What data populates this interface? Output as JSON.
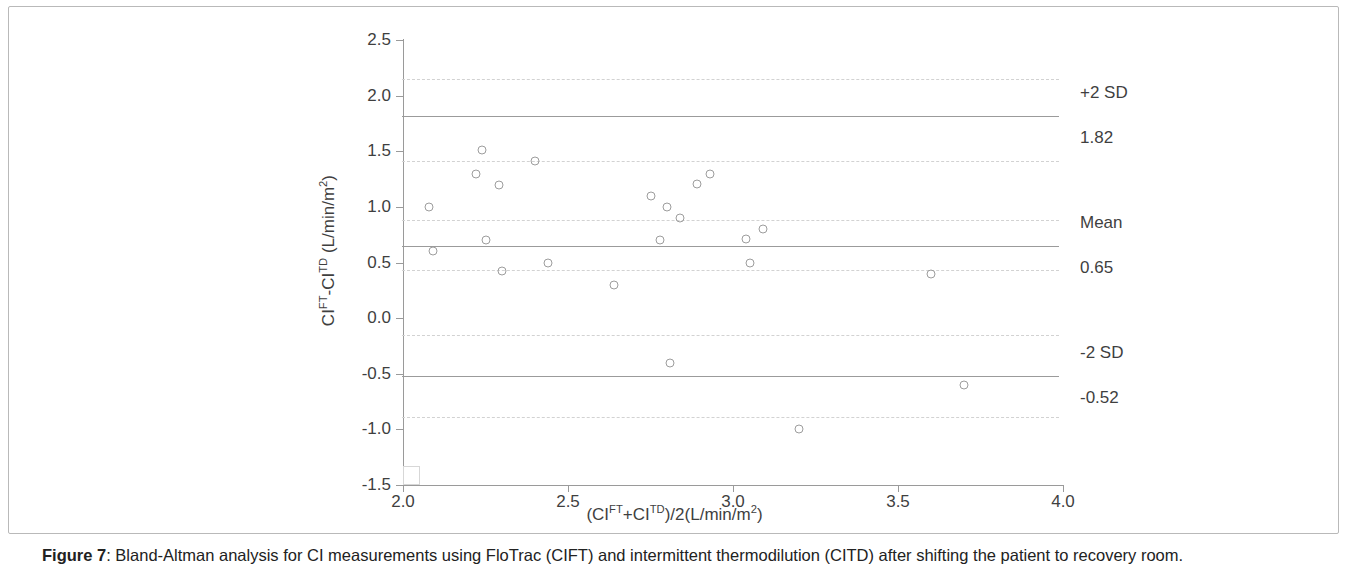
{
  "figure": {
    "caption_prefix": "Figure 7",
    "caption_sep": ": ",
    "caption_text": "Bland-Altman analysis for CI measurements using FloTrac (CIFT) and intermittent thermodilution (CITD) after shifting the patient to recovery room."
  },
  "axis_titles": {
    "x_pre": "(CI",
    "x_sup1": "FT",
    "x_mid": "+CI",
    "x_sup2": "TD",
    "x_post": ")/2(L/min/m",
    "x_sup3": "2",
    "x_end": ")",
    "y_pre": "CI",
    "y_sup1": "FT",
    "y_mid": "-CI",
    "y_sup2": "TD",
    "y_post": " (L/min/m",
    "y_sup3": "2",
    "y_end": ")"
  },
  "annotations": {
    "upper_label": "+2 SD",
    "upper_value": "1.82",
    "mean_label": "Mean",
    "mean_value": "0.65",
    "lower_label": "-2 SD",
    "lower_value": "-0.52"
  },
  "colors": {
    "axis": "#9a9a9a",
    "marker": "#9d9d9d",
    "reference_line": "#9b9b9b",
    "ci_line": "#d2d2d2",
    "text": "#3f3f3f",
    "frame": "#b9b9b9"
  },
  "chart_data": {
    "type": "scatter",
    "title": "",
    "xlabel": "(CI_FT+CI_TD)/2 (L/min/m^2)",
    "ylabel": "CI_FT-CI_TD (L/min/m^2)",
    "xlim": [
      2.0,
      4.0
    ],
    "ylim": [
      -1.5,
      2.5
    ],
    "xticks": [
      2.0,
      2.5,
      3.0,
      3.5,
      4.0
    ],
    "xtick_labels": [
      "2.0",
      "2.5",
      "3.0",
      "3.5",
      "4.0"
    ],
    "yticks": [
      -1.5,
      -1.0,
      -0.5,
      0.0,
      0.5,
      1.0,
      1.5,
      2.0,
      2.5
    ],
    "ytick_labels": [
      "-1.5",
      "-1.0",
      "-0.5",
      "0.0",
      "0.5",
      "1.0",
      "1.5",
      "2.0",
      "2.5"
    ],
    "grid": false,
    "legend": null,
    "points": [
      {
        "x": 2.08,
        "y": 1.0
      },
      {
        "x": 2.09,
        "y": 0.6
      },
      {
        "x": 2.22,
        "y": 1.3
      },
      {
        "x": 2.24,
        "y": 1.51
      },
      {
        "x": 2.25,
        "y": 0.7
      },
      {
        "x": 2.29,
        "y": 1.2
      },
      {
        "x": 2.3,
        "y": 0.42
      },
      {
        "x": 2.4,
        "y": 1.41
      },
      {
        "x": 2.44,
        "y": 0.5
      },
      {
        "x": 2.64,
        "y": 0.3
      },
      {
        "x": 2.75,
        "y": 1.1
      },
      {
        "x": 2.78,
        "y": 0.7
      },
      {
        "x": 2.8,
        "y": 1.0
      },
      {
        "x": 2.81,
        "y": -0.4
      },
      {
        "x": 2.84,
        "y": 0.9
      },
      {
        "x": 2.89,
        "y": 1.21
      },
      {
        "x": 2.93,
        "y": 1.3
      },
      {
        "x": 3.04,
        "y": 0.71
      },
      {
        "x": 3.05,
        "y": 0.5
      },
      {
        "x": 3.09,
        "y": 0.8
      },
      {
        "x": 3.2,
        "y": -1.0
      },
      {
        "x": 3.6,
        "y": 0.4
      },
      {
        "x": 3.7,
        "y": -0.6
      }
    ],
    "reference_lines": [
      {
        "name": "+2 SD",
        "value": 1.82,
        "style": "solid",
        "label": "+2 SD",
        "value_label": "1.82"
      },
      {
        "name": "Mean",
        "value": 0.65,
        "style": "solid",
        "label": "Mean",
        "value_label": "0.65"
      },
      {
        "name": "-2 SD",
        "value": -0.52,
        "style": "solid",
        "label": "-2 SD",
        "value_label": "-0.52"
      }
    ],
    "ci_lines": [
      {
        "value": 2.15,
        "style": "dashed"
      },
      {
        "value": 1.41,
        "style": "dashed"
      },
      {
        "value": 0.88,
        "style": "dashed"
      },
      {
        "value": 0.43,
        "style": "dashed"
      },
      {
        "value": -0.15,
        "style": "dashed"
      },
      {
        "value": -0.89,
        "style": "dashed"
      }
    ]
  }
}
